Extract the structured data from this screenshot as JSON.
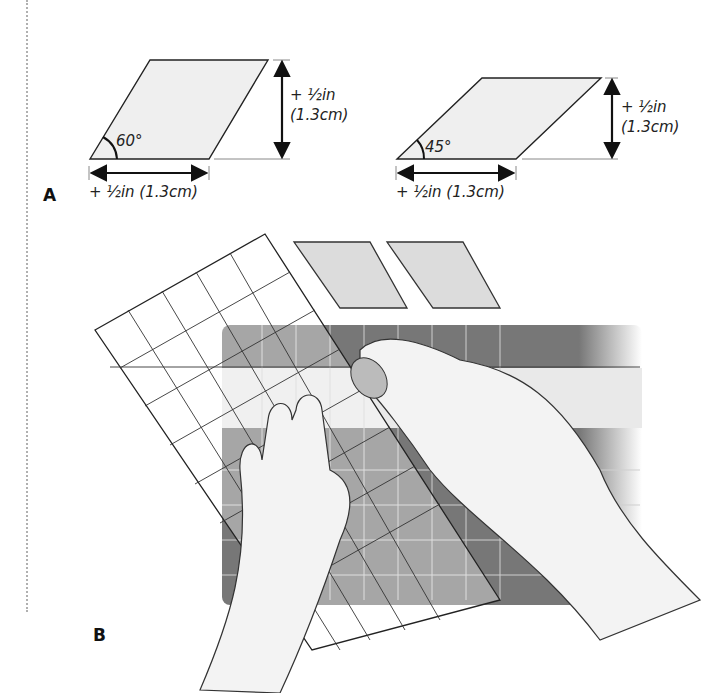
{
  "figure_a": {
    "label": "A",
    "shape_60": {
      "angle": "60°",
      "height_line1": "+ ½in",
      "height_line2": "(1.3cm)",
      "width_label": "+ ½in (1.3cm)"
    },
    "shape_45": {
      "angle": "45°",
      "height_line1": "+ ½in",
      "height_line2": "(1.3cm)",
      "width_label": "+ ½in (1.3cm)"
    }
  },
  "figure_b": {
    "label": "B",
    "description": "Hands cutting a fabric strip with a rotary cutter along an angled quilting ruler on a cutting mat; two cut diamonds shown above."
  },
  "colors": {
    "shape_fill": "#efefef",
    "mat_dark": "#6b6b6b",
    "mat_light": "#9a9a9a",
    "line": "#222222"
  }
}
